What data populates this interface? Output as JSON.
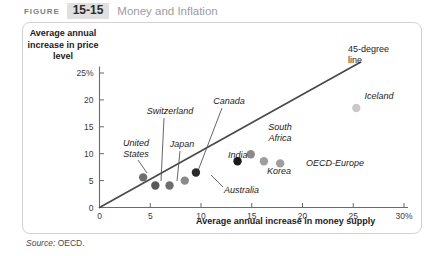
{
  "figure": {
    "label": "FIGURE",
    "number": "15-15",
    "title": "Money and Inflation"
  },
  "source": {
    "prefix": "Source:",
    "text": "OECD."
  },
  "chart_data": {
    "type": "scatter",
    "title": "Money and Inflation",
    "xlabel": "Average annual increase in money supply",
    "ylabel": "Average annual increase in price level",
    "xlim": [
      0,
      30
    ],
    "ylim": [
      0,
      27
    ],
    "grid": false,
    "legend": "none",
    "xticks": [
      "0",
      "5",
      "10",
      "15",
      "20",
      "25",
      "30%"
    ],
    "xtick_values": [
      0,
      5,
      10,
      15,
      20,
      25,
      30
    ],
    "yticks": [
      "0",
      "5",
      "10",
      "15",
      "20",
      "25%"
    ],
    "ytick_values": [
      0,
      5,
      10,
      15,
      20,
      25
    ],
    "annotations": [
      {
        "text": "45-degree line",
        "line1": "45-degree",
        "line2": "line"
      }
    ],
    "reference_line": {
      "name": "45-degree line",
      "from": [
        0,
        0
      ],
      "to": [
        25.7,
        27.0
      ],
      "color": "#4a4a4a"
    },
    "points": [
      {
        "name": "United States",
        "x": 4.3,
        "y": 5.6,
        "color": "#6e6e6e",
        "label_line1": "United",
        "label_line2": "States"
      },
      {
        "name": "Switzerland",
        "x": 5.5,
        "y": 4.1,
        "color": "#5a5a5a",
        "label_line1": "Switzerland",
        "label_line2": ""
      },
      {
        "name": "Japan",
        "x": 6.9,
        "y": 4.1,
        "color": "#6e6e6e",
        "label_line1": "Japan",
        "label_line2": ""
      },
      {
        "name": "Canada",
        "x": 8.4,
        "y": 5.0,
        "color": "#8a8a8a",
        "label_line1": "Canada",
        "label_line2": ""
      },
      {
        "name": "Australia",
        "x": 9.5,
        "y": 6.5,
        "color": "#2a2a2a",
        "label_line1": "Australia",
        "label_line2": ""
      },
      {
        "name": "India",
        "x": 13.6,
        "y": 8.6,
        "color": "#1a1a1a",
        "label_line1": "India",
        "label_line2": ""
      },
      {
        "name": "South Africa",
        "x": 14.9,
        "y": 9.9,
        "color": "#8a8a8a",
        "label_line1": "South",
        "label_line2": "Africa"
      },
      {
        "name": "Korea",
        "x": 16.2,
        "y": 8.6,
        "color": "#9e9e9e",
        "label_line1": "Korea",
        "label_line2": ""
      },
      {
        "name": "OECD-Europe",
        "x": 17.8,
        "y": 8.2,
        "color": "#9e9e9e",
        "label_line1": "OECD-Europe",
        "label_line2": ""
      },
      {
        "name": "Iceland",
        "x": 25.3,
        "y": 18.5,
        "color": "#c9c9c9",
        "label_line1": "Iceland",
        "label_line2": ""
      }
    ]
  },
  "colors": {
    "axis": "#6b6b6b",
    "line": "#4a4a4a",
    "panel_border": "#d2d2d2",
    "fig_num_bg": "#e0e0e0",
    "fig_title": "#9b9da1"
  }
}
